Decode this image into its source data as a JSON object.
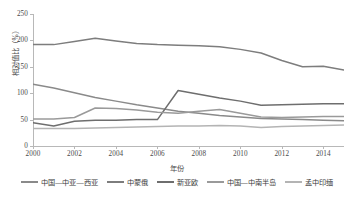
{
  "chart_data": {
    "type": "line",
    "title": "",
    "xlabel": "年份",
    "ylabel": "相对值比（%）",
    "xlim": [
      2000,
      2015
    ],
    "ylim": [
      0,
      250
    ],
    "yticks": [
      0,
      50,
      100,
      150,
      200,
      250
    ],
    "xticks": [
      2000,
      2002,
      2004,
      2006,
      2008,
      2010,
      2012,
      2014
    ],
    "x": [
      2000,
      2001,
      2002,
      2003,
      2004,
      2005,
      2006,
      2007,
      2008,
      2009,
      2010,
      2011,
      2012,
      2013,
      2014,
      2015
    ],
    "grid": false,
    "legend_position": "bottom",
    "series": [
      {
        "name": "中国—中亚—西亚",
        "color": "#8a8a8a",
        "values": [
          117,
          110,
          101,
          92,
          85,
          78,
          72,
          66,
          62,
          58,
          55,
          52,
          51,
          50,
          49,
          48
        ]
      },
      {
        "name": "中蒙俄",
        "color": "#7d7d7d",
        "values": [
          192,
          192,
          198,
          204,
          199,
          194,
          192,
          191,
          190,
          188,
          183,
          176,
          162,
          150,
          151,
          144
        ]
      },
      {
        "name": "新亚欧",
        "color": "#6e6e6e",
        "values": [
          44,
          38,
          47,
          49,
          49,
          50,
          50,
          105,
          98,
          91,
          85,
          77,
          78,
          79,
          80,
          80
        ]
      },
      {
        "name": "中国—中南半岛",
        "color": "#9a9a9a",
        "values": [
          51,
          51,
          54,
          72,
          71,
          68,
          64,
          62,
          66,
          69,
          62,
          55,
          54,
          55,
          56,
          56
        ]
      },
      {
        "name": "孟中印缅",
        "color": "#b4b4b4",
        "values": [
          33,
          33,
          33,
          34,
          35,
          36,
          37,
          38,
          38,
          39,
          38,
          35,
          37,
          38,
          39,
          40
        ]
      }
    ]
  }
}
